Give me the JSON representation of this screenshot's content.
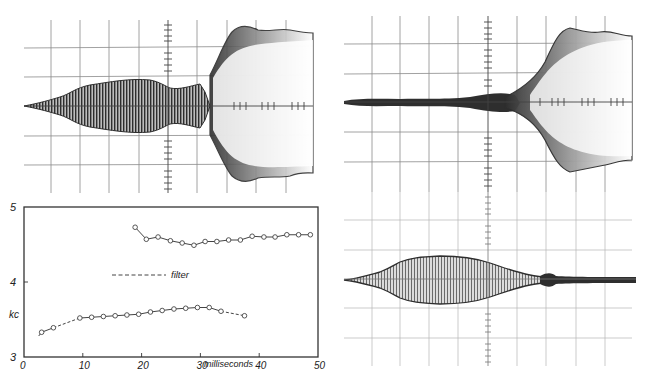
{
  "figure": {
    "panels": [
      {
        "id": "scope-top-left",
        "description": "oscilloscope trace: growing oscillation then breaking into wide envelope"
      },
      {
        "id": "scope-top-right",
        "description": "oscilloscope trace: quiet trace then widening envelope"
      },
      {
        "id": "scope-bottom-right",
        "description": "oscilloscope trace: spindle-shaped burst decaying to quiet"
      }
    ]
  },
  "colors": {
    "trace_dark": "#2e2e2e",
    "grid": "#8a8a8a",
    "axis": "#333333",
    "series": "#444444"
  },
  "chart_data": {
    "type": "line",
    "title": "",
    "xlabel": "milliseconds",
    "ylabel": "kc",
    "xlim": [
      0,
      50
    ],
    "ylim": [
      3,
      5
    ],
    "xticks": [
      "0",
      "10",
      "20",
      "30",
      "40",
      "50"
    ],
    "yticks": [
      "3",
      "4",
      "5"
    ],
    "grid": false,
    "legend": [
      {
        "label": "filter",
        "style": "dashed"
      }
    ],
    "series": [
      {
        "name": "upper",
        "x": [
          18.9,
          20.8,
          22.8,
          24.9,
          26.9,
          28.9,
          30.8,
          32.8,
          34.8,
          36.8,
          38.8,
          40.8,
          42.7,
          44.7,
          46.7,
          48.7
        ],
        "y": [
          4.73,
          4.57,
          4.6,
          4.55,
          4.52,
          4.49,
          4.54,
          4.54,
          4.56,
          4.56,
          4.61,
          4.6,
          4.6,
          4.63,
          4.63,
          4.63
        ]
      },
      {
        "name": "lower",
        "x": [
          3.0,
          5.0,
          9.5,
          11.5,
          13.5,
          15.5,
          17.5,
          19.5,
          21.5,
          23.5,
          25.5,
          27.5,
          29.5,
          31.5,
          33.5,
          37.5
        ],
        "y": [
          3.33,
          3.39,
          3.52,
          3.53,
          3.54,
          3.55,
          3.56,
          3.57,
          3.6,
          3.62,
          3.64,
          3.65,
          3.66,
          3.66,
          3.61,
          3.55
        ]
      }
    ],
    "dashed_segments": [
      {
        "from": [
          2.5,
          3.28
        ],
        "to": [
          3.0,
          3.33
        ]
      },
      {
        "from": [
          5.0,
          3.39
        ],
        "to": [
          9.5,
          3.52
        ]
      },
      {
        "from": [
          33.5,
          3.61
        ],
        "to": [
          37.5,
          3.55
        ]
      }
    ],
    "filter_legend_kc": 4.1
  }
}
